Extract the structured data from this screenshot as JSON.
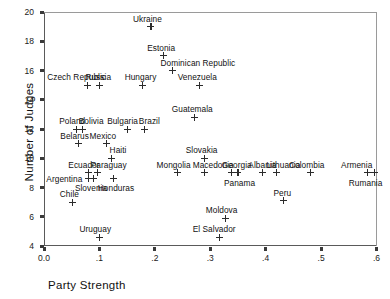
{
  "chart_data": {
    "type": "scatter",
    "title": "",
    "xlabel": "Party Strength",
    "ylabel": "Number of Judges",
    "xlim": [
      0.0,
      0.6
    ],
    "ylim": [
      4,
      20
    ],
    "grid": false,
    "legend": "none",
    "marker": "plus",
    "xticks": [
      "0.0",
      ".1",
      ".2",
      ".3",
      ".4",
      ".5",
      ".6"
    ],
    "xtick_values": [
      0.0,
      0.1,
      0.2,
      0.3,
      0.4,
      0.5,
      0.6
    ],
    "yticks": [
      "20",
      "18",
      "16",
      "14",
      "12",
      "10",
      "8",
      "6",
      "4"
    ],
    "ytick_values": [
      20,
      18,
      16,
      14,
      12,
      10,
      8,
      6,
      4
    ],
    "points": [
      {
        "label": "Ukraine",
        "x": 0.193,
        "y": 19.0,
        "lx": -18,
        "ly": -13
      },
      {
        "label": "Estonia",
        "x": 0.215,
        "y": 17.0,
        "lx": -16,
        "ly": -13
      },
      {
        "label": "Dominican Republic",
        "x": 0.232,
        "y": 16.0,
        "lx": -12,
        "ly": -13
      },
      {
        "label": "Hungary",
        "x": 0.178,
        "y": 15.0,
        "lx": -18,
        "ly": -13
      },
      {
        "label": "Venezuela",
        "x": 0.281,
        "y": 15.0,
        "lx": -22,
        "ly": -13
      },
      {
        "label": "Czech Republic",
        "x": 0.078,
        "y": 15.0,
        "lx": -40,
        "ly": -13
      },
      {
        "label": "Russia",
        "x": 0.1,
        "y": 15.0,
        "lx": -14,
        "ly": -13
      },
      {
        "label": "Guatemala",
        "x": 0.272,
        "y": 12.8,
        "lx": -23,
        "ly": -13
      },
      {
        "label": "Poland",
        "x": 0.058,
        "y": 12.0,
        "lx": -17,
        "ly": -13
      },
      {
        "label": "Bolivia",
        "x": 0.07,
        "y": 12.0,
        "lx": -4,
        "ly": -13
      },
      {
        "label": "Bulgaria",
        "x": 0.15,
        "y": 12.0,
        "lx": -20,
        "ly": -13
      },
      {
        "label": "Brazil",
        "x": 0.182,
        "y": 12.0,
        "lx": -6,
        "ly": -13
      },
      {
        "label": "Belarus",
        "x": 0.062,
        "y": 11.0,
        "lx": -18,
        "ly": -13
      },
      {
        "label": "Mexico",
        "x": 0.113,
        "y": 11.0,
        "lx": -17,
        "ly": -13
      },
      {
        "label": "Haiti",
        "x": 0.122,
        "y": 10.0,
        "lx": -2,
        "ly": -13
      },
      {
        "label": "Slovakia",
        "x": 0.29,
        "y": 10.0,
        "lx": -19,
        "ly": -13
      },
      {
        "label": "Ecuador",
        "x": 0.08,
        "y": 9.0,
        "lx": -20,
        "ly": -13
      },
      {
        "label": "Paraguay",
        "x": 0.097,
        "y": 9.0,
        "lx": -7,
        "ly": -13
      },
      {
        "label": "Mongolia",
        "x": 0.241,
        "y": 9.0,
        "lx": -21,
        "ly": -13
      },
      {
        "label": "Macedonia",
        "x": 0.29,
        "y": 9.0,
        "lx": -12,
        "ly": -13
      },
      {
        "label": "Georgia",
        "x": 0.339,
        "y": 9.0,
        "lx": -10,
        "ly": -13
      },
      {
        "label": "Panama",
        "x": 0.35,
        "y": 9.0,
        "lx": -14,
        "ly": 5
      },
      {
        "label": "Albania",
        "x": 0.394,
        "y": 9.0,
        "lx": -14,
        "ly": -13
      },
      {
        "label": "Lithuania",
        "x": 0.419,
        "y": 9.0,
        "lx": -10,
        "ly": -13
      },
      {
        "label": "Colombia",
        "x": 0.48,
        "y": 9.0,
        "lx": -21,
        "ly": -13
      },
      {
        "label": "Armenia",
        "x": 0.583,
        "y": 9.0,
        "lx": -26,
        "ly": -13
      },
      {
        "label": "Rumania",
        "x": 0.597,
        "y": 9.0,
        "lx": -26,
        "ly": 5
      },
      {
        "label": "Argentina",
        "x": 0.08,
        "y": 8.6,
        "lx": -42,
        "ly": -5
      },
      {
        "label": "Slovenia",
        "x": 0.09,
        "y": 8.6,
        "lx": -19,
        "ly": 4
      },
      {
        "label": "Honduras",
        "x": 0.126,
        "y": 8.6,
        "lx": -16,
        "ly": 4
      },
      {
        "label": "Peru",
        "x": 0.432,
        "y": 7.1,
        "lx": -10,
        "ly": -13
      },
      {
        "label": "Chile",
        "x": 0.052,
        "y": 7.0,
        "lx": -13,
        "ly": -13
      },
      {
        "label": "Moldova",
        "x": 0.328,
        "y": 5.9,
        "lx": -20,
        "ly": -13
      },
      {
        "label": "El Salvador",
        "x": 0.317,
        "y": 4.6,
        "lx": -27,
        "ly": -13
      },
      {
        "label": "Uruguay",
        "x": 0.1,
        "y": 4.6,
        "lx": -20,
        "ly": -13
      }
    ]
  }
}
